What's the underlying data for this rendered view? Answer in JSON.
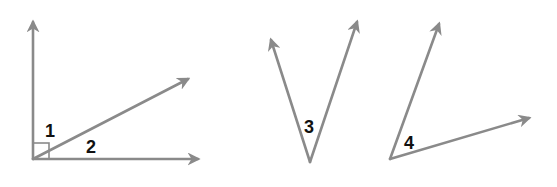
{
  "diagram": {
    "type": "angles",
    "colors": {
      "ray": "#8a8a8a",
      "label": "#111111",
      "background": "#ffffff"
    },
    "figures": [
      {
        "id": "figure-1",
        "description": "Right angle divided by a ray into angles 1 and 2",
        "vertex": [
          33,
          159
        ],
        "rays": [
          [
            33,
            20
          ],
          [
            200,
            159
          ],
          [
            190,
            78
          ]
        ],
        "right_angle_marker": true,
        "labels": [
          {
            "text": "1",
            "x": 45,
            "y": 137
          },
          {
            "text": "2",
            "x": 86,
            "y": 153
          }
        ]
      },
      {
        "id": "figure-2",
        "description": "Acute angle 3 opening upward",
        "vertex": [
          310,
          162
        ],
        "rays": [
          [
            271,
            38
          ],
          [
            358,
            20
          ]
        ],
        "labels": [
          {
            "text": "3",
            "x": 304,
            "y": 133
          }
        ]
      },
      {
        "id": "figure-3",
        "description": "Acute angle 4",
        "vertex": [
          390,
          159
        ],
        "rays": [
          [
            440,
            22
          ],
          [
            531,
            117
          ]
        ],
        "labels": [
          {
            "text": "4",
            "x": 404,
            "y": 149
          }
        ]
      }
    ]
  }
}
